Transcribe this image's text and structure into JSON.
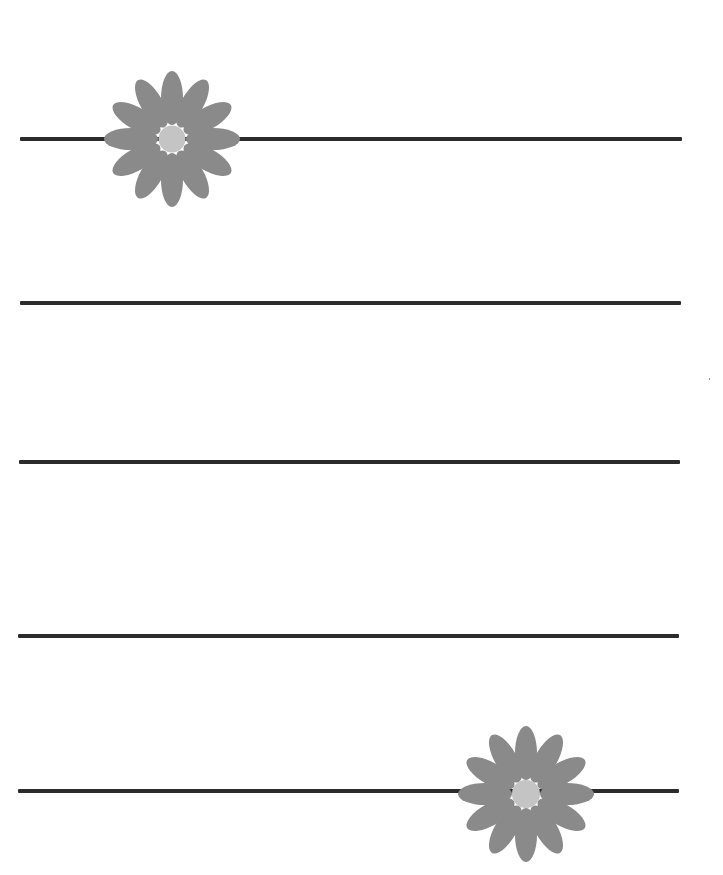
{
  "page": {
    "background": "#ffffff",
    "width": 723,
    "height": 875
  },
  "colors": {
    "line": "#2b2b2b",
    "petal": "#8a8a8a",
    "flower_center": "#c4c4c4"
  },
  "lines": [
    {
      "x1": 20,
      "x2": 682,
      "y": 137
    },
    {
      "x1": 20,
      "x2": 681,
      "y": 301
    },
    {
      "x1": 19,
      "x2": 680,
      "y": 460
    },
    {
      "x1": 18,
      "x2": 679,
      "y": 634
    },
    {
      "x1": 18,
      "x2": 679,
      "y": 789
    }
  ],
  "flowers": [
    {
      "icon": "daisy-icon",
      "cx": 172,
      "cy": 139,
      "petals": 12,
      "petal_length": 66,
      "center_radius": 13
    },
    {
      "icon": "daisy-icon",
      "cx": 526,
      "cy": 794,
      "petals": 12,
      "petal_length": 66,
      "center_radius": 14
    }
  ]
}
